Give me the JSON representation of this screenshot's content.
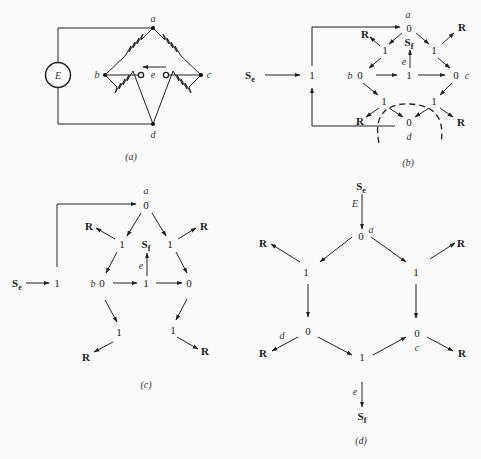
{
  "panels": {
    "a": {
      "caption": "(a)",
      "source_label": "E",
      "node_labels": {
        "a": "a",
        "b": "b",
        "c": "c",
        "d": "d"
      },
      "output_label": "e"
    },
    "b": {
      "caption": "(b)",
      "se": "Se",
      "sf": "Sf",
      "one": "1",
      "zero": "0",
      "r": "R",
      "node_labels": {
        "a": "a",
        "b": "b",
        "c": "c",
        "d": "d"
      },
      "effort_label": "e"
    },
    "c": {
      "caption": "(c)",
      "se": "Se",
      "sf": "Sf",
      "one": "1",
      "zero": "0",
      "r": "R",
      "node_labels": {
        "a": "a",
        "b": "b"
      },
      "effort_label": "e"
    },
    "d": {
      "caption": "(d)",
      "se": "Se",
      "sf": "Sf",
      "one": "1",
      "zero": "0",
      "r": "R",
      "node_labels": {
        "a": "a",
        "c": "c",
        "d": "d"
      },
      "source_effort": "E",
      "effort_label": "e"
    }
  }
}
